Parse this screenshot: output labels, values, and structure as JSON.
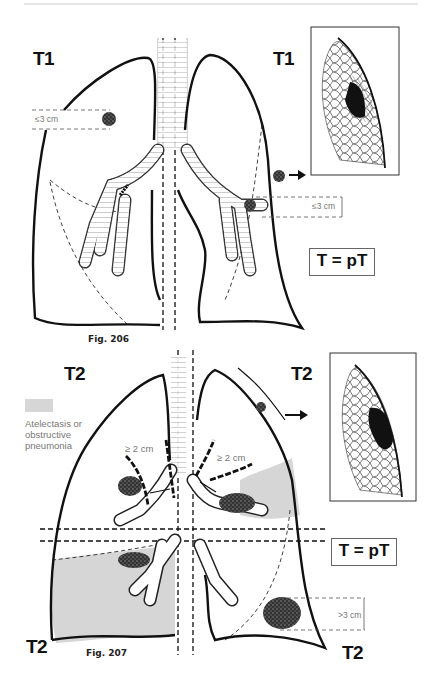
{
  "figures": [
    {
      "caption": "Fig. 206",
      "stage_labels": {
        "right_lung": "T1",
        "left_lung": "T1"
      },
      "measurements": {
        "right_tumor": "≤3 cm",
        "left_tumor": "≤3 cm"
      },
      "equation": "T = pT",
      "inset": "peripheral tumor with pleura, T1"
    },
    {
      "caption": "Fig. 207",
      "stage_labels": {
        "top_left": "T2",
        "top_right": "T2",
        "bottom_left": "T2",
        "bottom_right": "T2"
      },
      "measurements": {
        "right_carina_distance": "≥ 2 cm",
        "left_carina_distance": "≥ 2 cm",
        "left_lower_tumor": ">3 cm"
      },
      "legend": {
        "swatch_label": "Atelectasis or obstructive pneumonia",
        "swatch_color": "#d6d6d6"
      },
      "equations": [
        "T = pT"
      ],
      "inset": "peripheral tumor invading visceral pleura, T2"
    }
  ],
  "colors": {
    "ink": "#111111",
    "shading": "#d6d6d6",
    "label_grey": "#777777",
    "rule": "#cccccc"
  }
}
